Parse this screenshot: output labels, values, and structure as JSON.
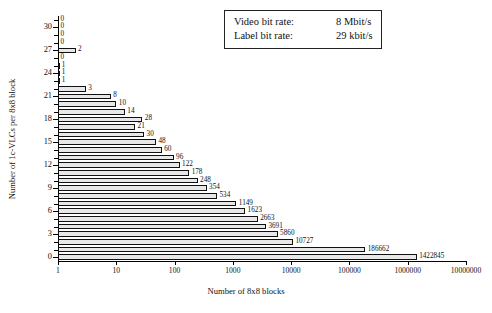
{
  "chart_data": {
    "type": "bar",
    "orientation": "horizontal",
    "title": "",
    "xlabel": "Number of 8x8 blocks",
    "ylabel": "Number of  1c-VLCs  per 8x8 block",
    "xscale": "log",
    "xlim": [
      1,
      10000000
    ],
    "ylim": [
      -0.5,
      31.5
    ],
    "grid": false,
    "xtick_labels": [
      "1",
      "10",
      "100",
      "1000",
      "10000",
      "100000",
      "1000000",
      "10000000"
    ],
    "xtick_values": [
      1,
      10,
      100,
      1000,
      10000,
      100000,
      1000000,
      10000000
    ],
    "ytick_labels": [
      "0",
      "3",
      "6",
      "9",
      "12",
      "15",
      "18",
      "21",
      "24",
      "27",
      "30"
    ],
    "ytick_values": [
      0,
      3,
      6,
      9,
      12,
      15,
      18,
      21,
      24,
      27,
      30
    ],
    "categories": [
      0,
      1,
      2,
      3,
      4,
      5,
      6,
      7,
      8,
      9,
      10,
      11,
      12,
      13,
      14,
      15,
      16,
      17,
      18,
      19,
      20,
      21,
      22,
      23,
      24,
      25,
      26,
      27,
      28,
      29,
      30,
      31
    ],
    "values": [
      1422845,
      186662,
      10727,
      5860,
      3691,
      2663,
      1623,
      1149,
      534,
      354,
      248,
      178,
      122,
      96,
      60,
      48,
      30,
      21,
      28,
      14,
      10,
      8,
      3,
      1,
      1,
      1,
      0,
      2,
      0,
      0,
      0,
      0
    ],
    "bar_labels": [
      "1422845",
      "186662",
      "10727",
      "5860",
      "3691",
      "2663",
      "1623",
      "1149",
      "534",
      "354",
      "248",
      "178",
      "122",
      "96",
      "60",
      "48",
      "30",
      "21",
      "28",
      "14",
      "10",
      "8",
      "3",
      "1",
      "1",
      "1",
      "0",
      "2",
      "0",
      "0",
      "0",
      "0"
    ],
    "bar_fill_color": "#e8e8e8",
    "bar_edge_color": "#111111"
  },
  "info_box": {
    "rows": [
      {
        "key": "Video bit rate:",
        "value": "8 Mbit/s"
      },
      {
        "key": "Label bit rate:",
        "value": "29 kbit/s"
      }
    ]
  }
}
